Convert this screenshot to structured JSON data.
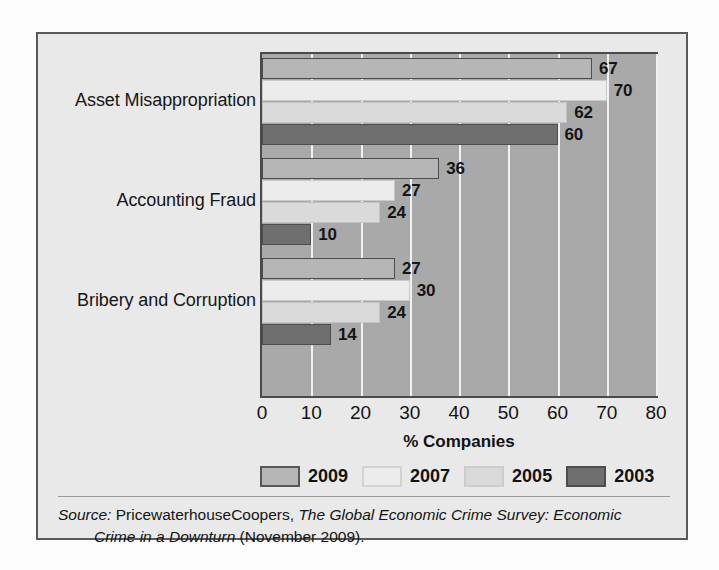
{
  "chart_data": {
    "type": "bar",
    "orientation": "horizontal",
    "title": "",
    "xlabel": "% Companies",
    "ylabel": "",
    "xlim": [
      0,
      80
    ],
    "xticks": [
      "0",
      "10",
      "20",
      "30",
      "40",
      "50",
      "60",
      "70",
      "80"
    ],
    "grid": "vertical-white-gridlines",
    "legend_position": "bottom",
    "categories": [
      "Asset Misappropriation",
      "Accounting Fraud",
      "Bribery and Corruption"
    ],
    "series": [
      {
        "name": "2009",
        "color": "#b6b6b6",
        "values": [
          67,
          36,
          27
        ]
      },
      {
        "name": "2007",
        "color": "#ececec",
        "values": [
          70,
          27,
          30
        ]
      },
      {
        "name": "2005",
        "color": "#dadada",
        "values": [
          62,
          24,
          24
        ]
      },
      {
        "name": "2003",
        "color": "#6f6f6f",
        "values": [
          60,
          10,
          14
        ]
      }
    ]
  },
  "legend": {
    "items": [
      {
        "label": "2009"
      },
      {
        "label": "2007"
      },
      {
        "label": "2005"
      },
      {
        "label": "2003"
      }
    ]
  },
  "axis": {
    "x_title": "% Companies"
  },
  "source": {
    "prefix": "Source:",
    "publisher": " PricewaterhouseCoopers, ",
    "title": "The Global Economic Crime Survey: Economic",
    "title_line2": "Crime in a Downturn",
    "date": " (November 2009)."
  }
}
